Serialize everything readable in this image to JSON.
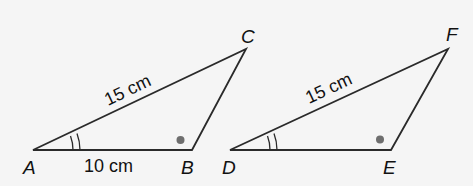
{
  "figure": {
    "background": "#f5f5f5",
    "stroke_color": "#2a2a2a",
    "dot_color": "#6e6e6e",
    "triangles": [
      {
        "name": "ABC",
        "vertices": {
          "A": {
            "label": "A",
            "x": 33,
            "y": 150
          },
          "B": {
            "label": "B",
            "x": 192,
            "y": 150
          },
          "C": {
            "label": "C",
            "x": 246,
            "y": 49
          }
        },
        "sides": {
          "AC": {
            "label": "15 cm"
          },
          "AB": {
            "label": "10 cm"
          }
        },
        "angle_marks": {
          "A": "double-arc",
          "B": "dot"
        }
      },
      {
        "name": "DEF",
        "vertices": {
          "D": {
            "label": "D",
            "x": 230,
            "y": 150
          },
          "E": {
            "label": "E",
            "x": 391,
            "y": 150
          },
          "F": {
            "label": "F",
            "x": 448,
            "y": 49
          }
        },
        "sides": {
          "DF": {
            "label": "15 cm"
          }
        },
        "angle_marks": {
          "D": "double-arc",
          "E": "dot"
        }
      }
    ]
  }
}
